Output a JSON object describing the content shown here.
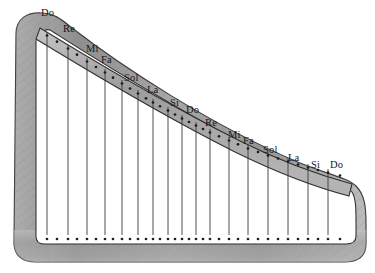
{
  "figure": {
    "name": "harp-diagram",
    "style": "pencil-sketch",
    "background_color": "#ffffff",
    "frame_color": "#9a9a9a",
    "outline_color": "#2b2b2b",
    "string_color": "#3a3a3a",
    "peg_color": "#1c1c1c"
  },
  "strings": [
    {
      "index": 1,
      "label": "Do",
      "top_x": 47,
      "top_y": 32,
      "bottom_x": 47,
      "bottom_y": 235,
      "label_x": 41,
      "label_y": 8
    },
    {
      "index": 2,
      "label": "Re",
      "top_x": 68,
      "top_y": 45,
      "bottom_x": 68,
      "bottom_y": 235,
      "label_x": 63,
      "label_y": 24
    },
    {
      "index": 3,
      "label": "Mi",
      "top_x": 87,
      "top_y": 58,
      "bottom_x": 87,
      "bottom_y": 235,
      "label_x": 86,
      "label_y": 44
    },
    {
      "index": 4,
      "label": "Fa",
      "top_x": 105,
      "top_y": 69,
      "bottom_x": 105,
      "bottom_y": 235,
      "label_x": 101,
      "label_y": 55
    },
    {
      "index": 5,
      "label": "Sol",
      "top_x": 122,
      "top_y": 80,
      "bottom_x": 122,
      "bottom_y": 235,
      "label_x": 124,
      "label_y": 73
    },
    {
      "index": 6,
      "label": "La",
      "top_x": 138,
      "top_y": 90,
      "bottom_x": 138,
      "bottom_y": 235,
      "label_x": 147,
      "label_y": 85
    },
    {
      "index": 7,
      "label": "Si",
      "top_x": 153,
      "top_y": 99,
      "bottom_x": 153,
      "bottom_y": 235,
      "label_x": 170,
      "label_y": 98
    },
    {
      "index": 8,
      "label": "Do",
      "top_x": 168,
      "top_y": 107,
      "bottom_x": 168,
      "bottom_y": 235,
      "label_x": 186,
      "label_y": 105
    },
    {
      "index": 9,
      "label": "Re",
      "top_x": 182,
      "top_y": 115,
      "bottom_x": 182,
      "bottom_y": 235,
      "label_x": 205,
      "label_y": 118
    },
    {
      "index": 10,
      "label": "Mi",
      "top_x": 196,
      "top_y": 122,
      "bottom_x": 196,
      "bottom_y": 235,
      "label_x": 228,
      "label_y": 130
    },
    {
      "index": 11,
      "label": "Fa",
      "top_x": 210,
      "top_y": 129,
      "bottom_x": 210,
      "bottom_y": 235,
      "label_x": 243,
      "label_y": 136
    },
    {
      "index": 12,
      "label": "Sol",
      "top_x": 229,
      "top_y": 137,
      "bottom_x": 229,
      "bottom_y": 235,
      "label_x": 263,
      "label_y": 145
    },
    {
      "index": 13,
      "label": "La",
      "top_x": 248,
      "top_y": 145,
      "bottom_x": 248,
      "bottom_y": 235,
      "label_x": 288,
      "label_y": 153
    },
    {
      "index": 14,
      "label": "Si",
      "top_x": 268,
      "top_y": 152,
      "bottom_x": 268,
      "bottom_y": 235,
      "label_x": 311,
      "label_y": 160
    },
    {
      "index": 15,
      "label": "Do",
      "top_x": 288,
      "top_y": 158,
      "bottom_x": 288,
      "bottom_y": 235,
      "label_x": 330,
      "label_y": 160
    },
    {
      "index": 16,
      "label": "",
      "top_x": 308,
      "top_y": 164,
      "bottom_x": 308,
      "bottom_y": 235,
      "label_x": 0,
      "label_y": 0
    },
    {
      "index": 17,
      "label": "",
      "top_x": 328,
      "top_y": 169,
      "bottom_x": 328,
      "bottom_y": 235,
      "label_x": 0,
      "label_y": 0
    }
  ],
  "neck_pegs_x": [
    47,
    57,
    68,
    77,
    87,
    96,
    105,
    113,
    122,
    130,
    138,
    146,
    153,
    160,
    168,
    175,
    182,
    189,
    196,
    203,
    210,
    219,
    229,
    238,
    248,
    258,
    268,
    278,
    288,
    298,
    308,
    318,
    328,
    340
  ],
  "base_pegs_x": [
    47,
    57,
    68,
    77,
    87,
    96,
    105,
    113,
    122,
    130,
    138,
    146,
    153,
    160,
    168,
    175,
    182,
    189,
    196,
    203,
    210,
    219,
    229,
    238,
    248,
    258,
    268,
    278,
    288,
    298,
    308,
    318,
    328,
    340
  ],
  "labels_note_names": [
    "Do",
    "Re",
    "Mi",
    "Fa",
    "Sol",
    "La",
    "Si",
    "Do",
    "Re",
    "Mi",
    "Fa",
    "Sol",
    "La",
    "Si",
    "Do"
  ]
}
